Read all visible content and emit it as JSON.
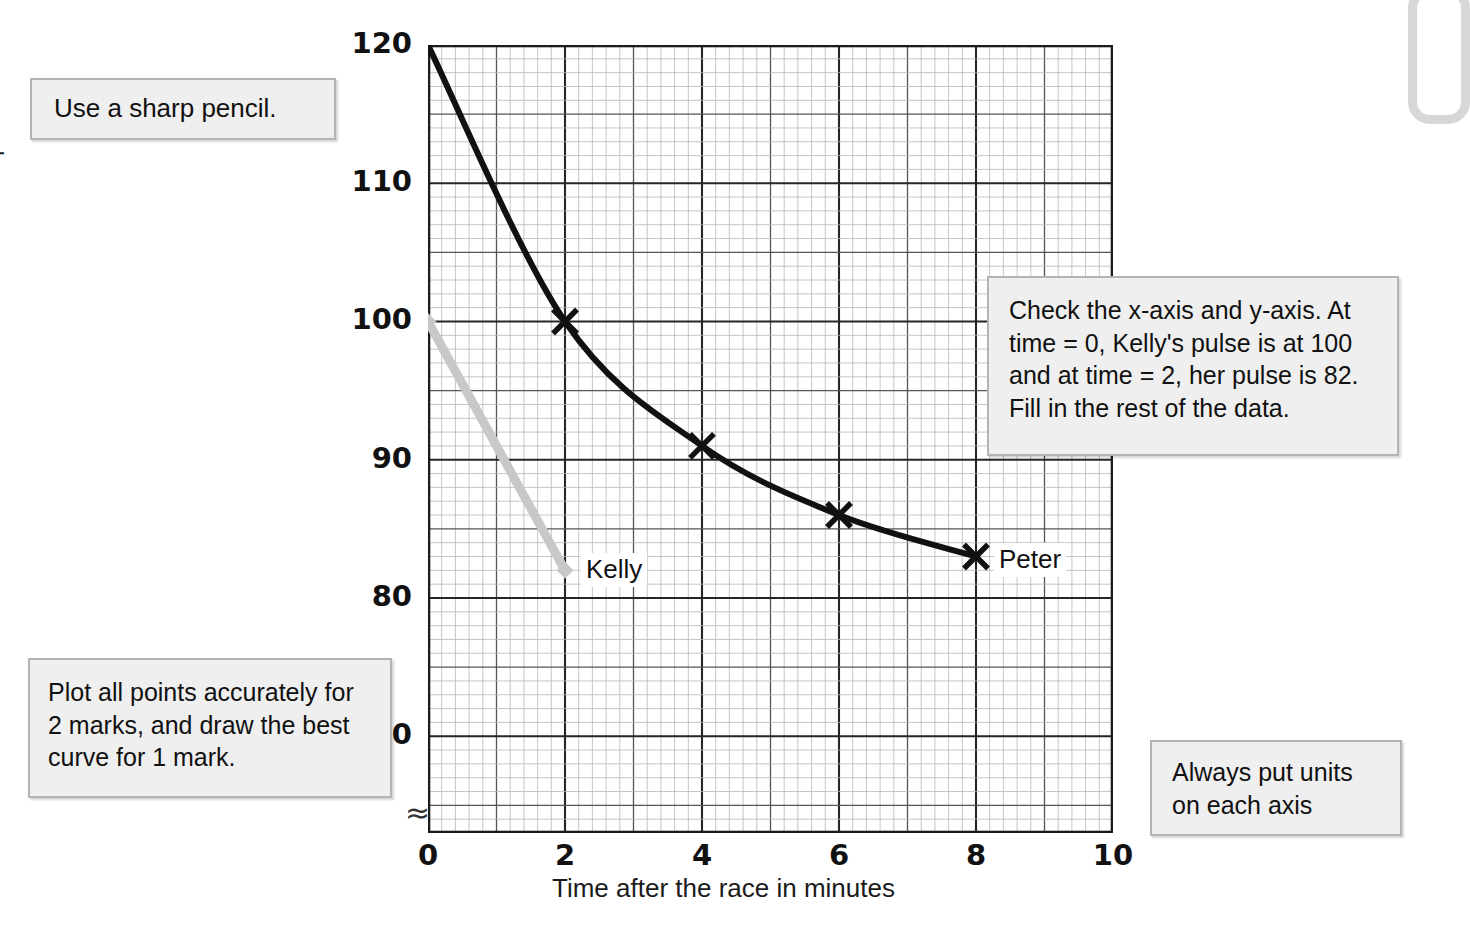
{
  "chart_data": {
    "type": "line",
    "title": "",
    "xlabel": "Time after the race in minutes",
    "ylabel": "Pulse rate in beats per minute",
    "xlim": [
      0,
      10
    ],
    "ylim": [
      63,
      120
    ],
    "xticks": [
      "0",
      "2",
      "4",
      "6",
      "8",
      "10"
    ],
    "xtick_values": [
      0,
      2,
      4,
      6,
      8,
      10
    ],
    "yticks": [
      "70",
      "80",
      "90",
      "100",
      "110",
      "120"
    ],
    "ytick_values": [
      70,
      80,
      90,
      100,
      110,
      120
    ],
    "grid": "on",
    "legend": "inline-labels",
    "axis_break": "≈",
    "series": [
      {
        "name": "Peter",
        "color": "#111111",
        "marker": "x-cross",
        "x": [
          0,
          2,
          4,
          6,
          8
        ],
        "values": [
          120,
          100,
          91,
          86,
          83
        ],
        "label": "Peter"
      },
      {
        "name": "Kelly",
        "color": "#c8c8c8",
        "marker": "diamond",
        "x": [
          0,
          2
        ],
        "values": [
          100,
          82
        ],
        "label": "Kelly"
      }
    ]
  },
  "notes": {
    "pencil": "Use a sharp pencil.",
    "plot_points": "Plot all points accurately for 2 marks, and draw the best curve for 1 mark.",
    "check_axes": "Check the x-axis and y-axis. At time = 0, Kelly's pulse is at 100 and at time = 2, her pulse is 82. Fill in the rest of the data.",
    "units": "Always put units on each axis"
  }
}
